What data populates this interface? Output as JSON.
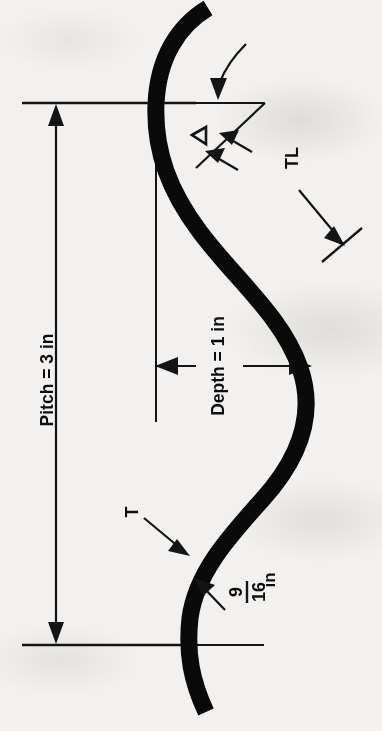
{
  "figure": {
    "kind": "engineering-dimension-diagram",
    "orientation": "rotated-90-ccw",
    "ink_color": "#0d0d0d",
    "paper_color": "#f2f1ef"
  },
  "labels": {
    "pitch": "Pitch = 3 in",
    "depth": "Depth = 1 in",
    "tl": "TL",
    "thickness": "T",
    "fraction_numerator": "9",
    "fraction_denominator": "16",
    "fraction_unit": "in",
    "angle_symbol": "◁"
  },
  "dimensions": [
    {
      "name": "pitch",
      "label": "Pitch = 3 in",
      "value": 3,
      "unit": "in",
      "style": "double-arrow"
    },
    {
      "name": "depth",
      "label": "Depth = 1 in",
      "value": 1,
      "unit": "in",
      "style": "double-arrow"
    },
    {
      "name": "radius",
      "label": "9/16 in",
      "value": 0.5625,
      "unit": "in",
      "style": "leader-arrow"
    },
    {
      "name": "tangent-length",
      "label": "TL",
      "style": "leader-arrow"
    },
    {
      "name": "thickness",
      "label": "T",
      "style": "leader-arrow"
    },
    {
      "name": "angle",
      "label": "◁",
      "style": "curved-leader-arrow"
    }
  ],
  "callouts": {
    "tl_note": "TL",
    "t_note": "T",
    "angle_note": "◁"
  }
}
